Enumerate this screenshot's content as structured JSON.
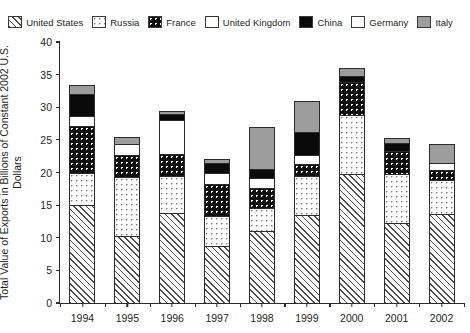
{
  "chart_data": {
    "type": "bar",
    "subtype": "stacked-bar",
    "title": "",
    "xlabel": "",
    "ylabel": "Total Value of Exports in Billions of Constant 2002 U.S. Dollars",
    "ylim": [
      0,
      40
    ],
    "yticks": [
      0,
      5,
      10,
      15,
      20,
      25,
      30,
      35,
      40
    ],
    "grid": false,
    "legend_position": "top",
    "categories": [
      "1994",
      "1995",
      "1996",
      "1997",
      "1998",
      "1999",
      "2000",
      "2001",
      "2002"
    ],
    "series": [
      {
        "name": "United States",
        "pattern": "diagonal-hatch",
        "values": [
          15.0,
          10.3,
          13.8,
          8.8,
          11.0,
          13.5,
          19.8,
          12.3,
          13.7
        ]
      },
      {
        "name": "Russia",
        "pattern": "light-dots-on-white",
        "values": [
          4.9,
          9.0,
          5.7,
          4.6,
          3.5,
          6.0,
          9.0,
          7.4,
          5.2
        ]
      },
      {
        "name": "France",
        "pattern": "white-dots-on-black",
        "values": [
          7.2,
          3.4,
          3.4,
          4.8,
          3.2,
          1.8,
          5.0,
          3.6,
          1.5
        ]
      },
      {
        "name": "United Kingdom",
        "pattern": "solid-white",
        "values": [
          1.6,
          1.7,
          5.2,
          1.8,
          1.5,
          1.4,
          0.0,
          0.0,
          0.0
        ]
      },
      {
        "name": "China",
        "pattern": "solid-black",
        "values": [
          3.3,
          0.0,
          0.8,
          1.4,
          1.4,
          3.5,
          1.0,
          1.3,
          0.0
        ]
      },
      {
        "name": "Germany",
        "pattern": "solid-white-outline",
        "values": [
          0.0,
          0.0,
          0.0,
          0.0,
          0.0,
          0.0,
          0.0,
          0.0,
          1.0
        ]
      },
      {
        "name": "Italy",
        "pattern": "solid-gray",
        "values": [
          1.4,
          1.1,
          0.5,
          0.7,
          6.4,
          4.8,
          1.2,
          0.7,
          3.0
        ]
      }
    ],
    "totals": [
      33.4,
      25.5,
      29.4,
      22.1,
      27.0,
      31.0,
      36.0,
      25.3,
      24.4
    ]
  },
  "legend": {
    "items": [
      {
        "label": "United States",
        "swatch": "diagonal-hatch-swatch"
      },
      {
        "label": "Russia",
        "swatch": "light-dots-swatch"
      },
      {
        "label": "France",
        "swatch": "black-dots-swatch"
      },
      {
        "label": "United Kingdom",
        "swatch": "white-swatch"
      },
      {
        "label": "China",
        "swatch": "black-swatch"
      },
      {
        "label": "Germany",
        "swatch": "white-outline-swatch"
      },
      {
        "label": "Italy",
        "swatch": "gray-swatch"
      }
    ]
  },
  "colors": {
    "axis": "#2b2b2b",
    "text": "#231f20",
    "italy_gray": "#9d9d9d",
    "china_black": "#0a0a0a",
    "background": "#ffffff"
  }
}
